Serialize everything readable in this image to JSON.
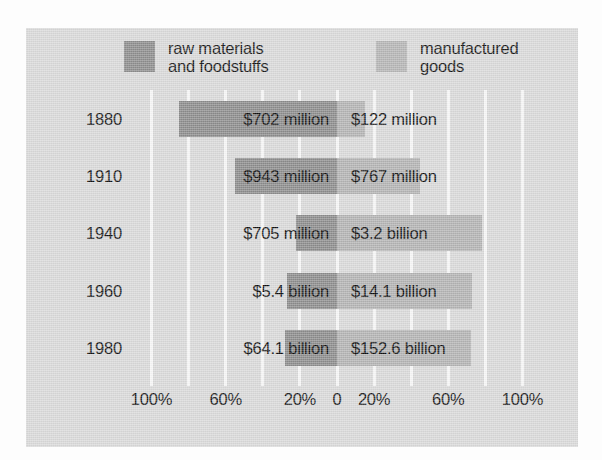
{
  "chart_data": {
    "type": "bar",
    "title": "",
    "subtitle": "",
    "orientation": "horizontal-diverging",
    "xlabel": "",
    "ylabel": "",
    "grid": true,
    "legend_position": "top",
    "axis": {
      "zero_label": "0",
      "tick_labels": [
        "100%",
        "60%",
        "20%",
        "0",
        "20%",
        "60%",
        "100%"
      ],
      "tick_percents": [
        -100,
        -60,
        -20,
        0,
        20,
        60,
        100
      ],
      "left_range": [
        0,
        100
      ],
      "right_range": [
        0,
        100
      ],
      "unit": "percent of total trade value"
    },
    "legend": [
      {
        "name": "raw-materials",
        "label": "raw materials\nand foodstuffs",
        "color": "#8c8c8c"
      },
      {
        "name": "manufactured-goods",
        "label": "manufactured\ngoods",
        "color": "#b4b4b4"
      }
    ],
    "categories": [
      "1880",
      "1910",
      "1940",
      "1960",
      "1980"
    ],
    "series": [
      {
        "name": "raw materials and foodstuffs",
        "side": "left",
        "color": "#8b8b8b",
        "values": [
          85,
          55,
          22,
          27,
          28
        ],
        "value_labels": [
          "$702 million",
          "$943 million",
          "$705 million",
          "$5.4 billion",
          "$64.1 billion"
        ]
      },
      {
        "name": "manufactured goods",
        "side": "right",
        "color": "#b2b2b2",
        "values": [
          15,
          45,
          78,
          73,
          72
        ],
        "value_labels": [
          "$122 million",
          "$767 million",
          "$3.2 billion",
          "$14.1 billion",
          "$152.6 billion"
        ]
      }
    ],
    "rows": [
      {
        "year": "1880",
        "left": {
          "label": "$702 million",
          "percent": 85,
          "label_inside": true
        },
        "right": {
          "label": "$122 million",
          "percent": 15,
          "label_inside": false
        }
      },
      {
        "year": "1910",
        "left": {
          "label": "$943 million",
          "percent": 55,
          "label_inside": true
        },
        "right": {
          "label": "$767 million",
          "percent": 45,
          "label_inside": true
        }
      },
      {
        "year": "1940",
        "left": {
          "label": "$705 million",
          "percent": 22,
          "label_inside": false
        },
        "right": {
          "label": "$3.2 billion",
          "percent": 78,
          "label_inside": true
        }
      },
      {
        "year": "1960",
        "left": {
          "label": "$5.4 billion",
          "percent": 27,
          "label_inside": false
        },
        "right": {
          "label": "$14.1 billion",
          "percent": 73,
          "label_inside": true
        }
      },
      {
        "year": "1980",
        "left": {
          "label": "$64.1 billion",
          "percent": 28,
          "label_inside": false
        },
        "right": {
          "label": "$152.6 billion",
          "percent": 72,
          "label_inside": true
        }
      }
    ],
    "colors": {
      "background": "#d8d8d8",
      "gridline": "#f6f6f6",
      "dark_bar": "#8b8b8b",
      "light_bar": "#b2b2b2",
      "text": "#131313"
    }
  }
}
